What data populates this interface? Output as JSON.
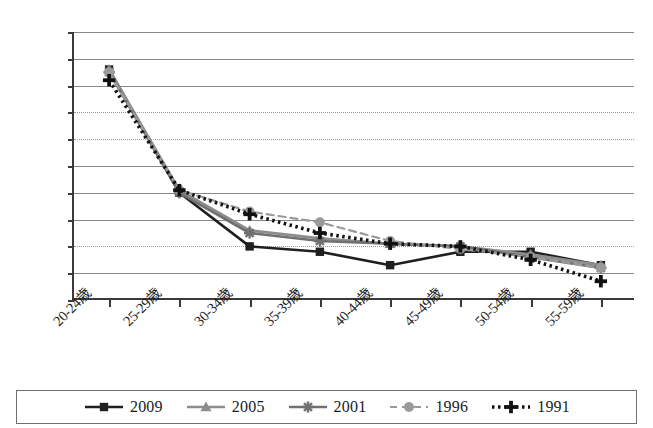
{
  "chart_data": {
    "type": "line",
    "title": "",
    "subtitle": "",
    "xlabel": "",
    "ylabel": "",
    "ylim": [
      0,
      100
    ],
    "y_tick_labels": [
      "100%",
      "90%",
      "80%",
      "70%",
      "60%",
      "50%",
      "40%",
      "30%",
      "20%",
      "10%",
      "0%"
    ],
    "y_tick_values": [
      100,
      90,
      80,
      70,
      60,
      50,
      40,
      30,
      20,
      10,
      0
    ],
    "grid": true,
    "legend_position": "bottom",
    "categories": [
      "20-24歳",
      "25-29歳",
      "30-34歳",
      "35-39歳",
      "40-44歳",
      "45-49歳",
      "50-54歳",
      "55-59歳"
    ],
    "series": [
      {
        "name": "2009",
        "color": "#1f1f1f",
        "marker": "square",
        "dash": "solid",
        "values": [
          86,
          40,
          20,
          18,
          13,
          18,
          18,
          13
        ]
      },
      {
        "name": "2005",
        "color": "#8d8d8d",
        "marker": "triangle",
        "dash": "solid",
        "values": [
          86,
          41,
          26,
          23,
          21,
          20,
          17,
          13
        ]
      },
      {
        "name": "2001",
        "color": "#707070",
        "marker": "asterisk",
        "dash": "solid",
        "values": [
          85,
          40,
          25,
          22,
          21,
          20,
          16,
          12
        ]
      },
      {
        "name": "1996",
        "color": "#9a9a9a",
        "marker": "circle",
        "dash": "dashed",
        "values": [
          85,
          41,
          33,
          29,
          22,
          19,
          16,
          12
        ]
      },
      {
        "name": "1991",
        "color": "#111111",
        "marker": "plus",
        "dash": "dotted",
        "values": [
          82,
          41,
          32,
          25,
          21,
          20,
          15,
          7
        ]
      }
    ]
  },
  "legend": {
    "items": [
      {
        "label": "2009"
      },
      {
        "label": "2005"
      },
      {
        "label": "2001"
      },
      {
        "label": "1996"
      },
      {
        "label": "1991"
      }
    ]
  }
}
